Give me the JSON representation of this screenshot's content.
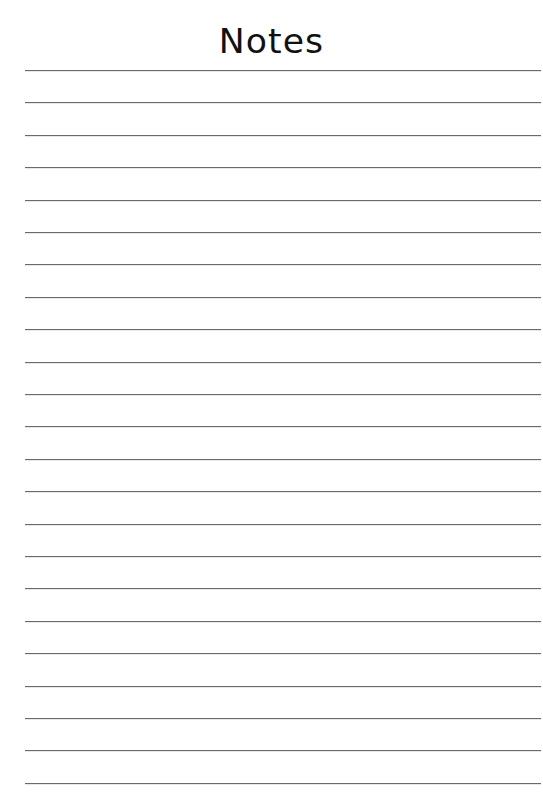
{
  "page": {
    "title": "Notes",
    "line_count": 23,
    "first_line_y": 70,
    "line_spacing": 32.4,
    "line_color": "#6a6a6a",
    "background": "#ffffff"
  }
}
